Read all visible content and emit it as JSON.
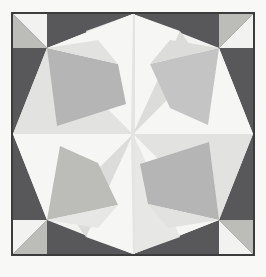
{
  "page": {
    "width": 266,
    "height": 277,
    "background_color": "#f8f8f6",
    "top_mark": "",
    "caption": ""
  },
  "frame": {
    "name": "panel-frame",
    "x": 11,
    "y": 12,
    "width": 244,
    "height": 244,
    "stroke_color": "#3c3c3c",
    "stroke_width": 2,
    "fill_color": "#ededeb"
  },
  "palette": {
    "dark_gray": "#58585a",
    "dark_gray_alt": "#606062",
    "mid_gray": "#b5b5b5",
    "mid_gray_warm": "#bcbcb8",
    "mid_gray_cool": "#c4c4c4",
    "light_gray": "#dcdcda",
    "pale": "#e9e9e7",
    "near_white": "#f2f2f0",
    "white": "#fafaf8",
    "frame_stroke": "#3c3c3c"
  },
  "geometry": {
    "center": {
      "x": 133,
      "y": 134
    },
    "corner_block_size": 34,
    "description": "Symmetric six-point star / pinwheel composed of flat-shaded triangles inside a square frame, with dark gray blocks occupying the four corner bands."
  },
  "shapes": [
    {
      "id": "bg-panel",
      "name": "panel-background",
      "fill": "#ededeb",
      "points": "13,14 253,14 253,254 13,254"
    },
    {
      "id": "corner-tl-block",
      "name": "corner-block-top-left",
      "fill": "#58585a",
      "points": "13,14 47,14 47,48 13,48"
    },
    {
      "id": "corner-tr-block",
      "name": "corner-block-top-right",
      "fill": "#58585a",
      "points": "219,14 253,14 253,48 219,48"
    },
    {
      "id": "corner-bl-block",
      "name": "corner-block-bottom-left",
      "fill": "#58585a",
      "points": "13,220 47,220 47,254 13,254"
    },
    {
      "id": "corner-br-block",
      "name": "corner-block-bottom-right",
      "fill": "#58585a",
      "points": "219,220 253,220 253,254 219,254"
    },
    {
      "id": "band-left-upper",
      "name": "edge-band-left-upper",
      "fill": "#58585a",
      "points": "13,48 47,48 47,134 13,134"
    },
    {
      "id": "band-left-lower",
      "name": "edge-band-left-lower",
      "fill": "#58585a",
      "points": "13,134 47,134 47,220 13,220"
    },
    {
      "id": "band-right-upper",
      "name": "edge-band-right-upper",
      "fill": "#58585a",
      "points": "219,48 253,48 253,134 219,134"
    },
    {
      "id": "band-right-lower",
      "name": "edge-band-right-lower",
      "fill": "#58585a",
      "points": "219,134 253,134 253,220 219,220"
    },
    {
      "id": "band-top-left",
      "name": "edge-band-top-left",
      "fill": "#58585a",
      "points": "47,14 133,14 133,48 47,48"
    },
    {
      "id": "band-top-right",
      "name": "edge-band-top-right",
      "fill": "#58585a",
      "points": "133,14 219,14 219,48 133,48"
    },
    {
      "id": "band-bottom-left",
      "name": "edge-band-bottom-left",
      "fill": "#58585a",
      "points": "47,220 133,220 133,254 47,254"
    },
    {
      "id": "band-bottom-right",
      "name": "edge-band-bottom-right",
      "fill": "#58585a",
      "points": "133,220 219,220 219,254 133,254"
    },
    {
      "id": "hex-body",
      "name": "central-hexagon-body",
      "fill": "#f2f2f0",
      "points": "133,14 219,48 253,134 219,220 133,254 47,220 13,134 47,48"
    },
    {
      "id": "tl-corner-light",
      "name": "corner-light-wedge-top-left",
      "fill": "#f2f2f0",
      "points": "13,14 47,14 47,48"
    },
    {
      "id": "tl-corner-mid",
      "name": "corner-mid-wedge-top-left",
      "fill": "#bcbcb8",
      "points": "13,14 47,48 13,48"
    },
    {
      "id": "tr-corner-light",
      "name": "corner-light-wedge-top-right",
      "fill": "#f2f2f0",
      "points": "253,14 253,48 219,48"
    },
    {
      "id": "tr-corner-mid",
      "name": "corner-mid-wedge-top-right",
      "fill": "#bcbcb8",
      "points": "253,14 219,48 219,14"
    },
    {
      "id": "bl-corner-light",
      "name": "corner-light-wedge-bottom-left",
      "fill": "#f2f2f0",
      "points": "13,254 13,220 47,220"
    },
    {
      "id": "bl-corner-mid",
      "name": "corner-mid-wedge-bottom-left",
      "fill": "#bcbcb8",
      "points": "13,254 47,220 47,254"
    },
    {
      "id": "br-corner-light",
      "name": "corner-light-wedge-bottom-right",
      "fill": "#f2f2f0",
      "points": "253,254 219,254 219,220"
    },
    {
      "id": "br-corner-mid",
      "name": "corner-mid-wedge-bottom-right",
      "fill": "#bcbcb8",
      "points": "253,254 219,220 253,220"
    },
    {
      "id": "pin-n-left",
      "name": "pinwheel-north-left",
      "fill": "#e7e7e5",
      "points": "133,134 133,14 86,31"
    },
    {
      "id": "pin-n-right",
      "name": "pinwheel-north-right",
      "fill": "#f6f6f4",
      "points": "133,134 133,14 180,31"
    },
    {
      "id": "pin-ne",
      "name": "pinwheel-northeast",
      "fill": "#dcdcda",
      "points": "133,134 180,31 253,134"
    },
    {
      "id": "pin-e-up",
      "name": "pinwheel-east-upper",
      "fill": "#f6f6f4",
      "points": "133,134 253,134 219,48"
    },
    {
      "id": "pin-e-dn",
      "name": "pinwheel-east-lower",
      "fill": "#e2e2e0",
      "points": "133,134 253,134 219,220"
    },
    {
      "id": "pin-se",
      "name": "pinwheel-southeast",
      "fill": "#f6f6f4",
      "points": "133,134 219,220 133,254"
    },
    {
      "id": "pin-s-right",
      "name": "pinwheel-south-right",
      "fill": "#e7e7e5",
      "points": "133,134 133,254 180,237"
    },
    {
      "id": "pin-s-left",
      "name": "pinwheel-south-left",
      "fill": "#f6f6f4",
      "points": "133,134 133,254 86,237"
    },
    {
      "id": "pin-sw",
      "name": "pinwheel-southwest",
      "fill": "#dcdcda",
      "points": "133,134 86,237 13,134"
    },
    {
      "id": "pin-w-dn",
      "name": "pinwheel-west-lower",
      "fill": "#f6f6f4",
      "points": "133,134 13,134 47,220"
    },
    {
      "id": "pin-w-up",
      "name": "pinwheel-west-upper",
      "fill": "#e2e2e0",
      "points": "133,134 13,134 47,48"
    },
    {
      "id": "pin-nw",
      "name": "pinwheel-northwest",
      "fill": "#f6f6f4",
      "points": "133,134 47,48 133,14"
    },
    {
      "id": "kite-nw",
      "name": "facet-kite-northwest",
      "fill": "#b5b5b5",
      "points": "47,48 118,64 126,104 57,126"
    },
    {
      "id": "kite-ne",
      "name": "facet-kite-northeast",
      "fill": "#c4c4c4",
      "points": "219,48 208,125 170,108 150,64"
    },
    {
      "id": "kite-sw",
      "name": "facet-kite-southwest",
      "fill": "#bcbcb8",
      "points": "47,220 60,146 98,163 118,205"
    },
    {
      "id": "kite-se",
      "name": "facet-kite-southeast",
      "fill": "#b5b5b5",
      "points": "219,220 148,204 140,164 209,142"
    },
    {
      "id": "sliver-nw",
      "name": "facet-sliver-northwest",
      "fill": "#e2e2e0",
      "points": "47,48 118,64 98,40"
    },
    {
      "id": "sliver-ne",
      "name": "facet-sliver-northeast",
      "fill": "#dcdcda",
      "points": "219,48 150,64 170,40"
    },
    {
      "id": "sliver-sw",
      "name": "facet-sliver-southwest",
      "fill": "#e7e7e5",
      "points": "47,220 118,205 98,228"
    },
    {
      "id": "sliver-se",
      "name": "facet-sliver-southeast",
      "fill": "#e2e2e0",
      "points": "219,220 148,204 168,228"
    },
    {
      "id": "seam-n",
      "name": "seam-north",
      "fill": "#e4e4e2",
      "points": "133,14 135,14 135,134 131,134"
    },
    {
      "id": "seam-s",
      "name": "seam-south",
      "fill": "#e4e4e2",
      "points": "131,134 135,134 135,254 133,254"
    }
  ]
}
